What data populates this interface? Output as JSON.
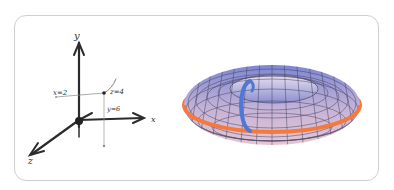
{
  "figure": {
    "left_panel": {
      "type": "hand-drawn 3D coordinate axes",
      "axes": {
        "x_label": "x",
        "y_label": "y",
        "z_label": "z"
      },
      "point_annotations": {
        "x": "x=2",
        "y": "y=6",
        "z": "z=4"
      }
    },
    "right_panel": {
      "type": "torus surface with two loops",
      "loops": [
        {
          "name": "longitude loop",
          "color": "#f4793b"
        },
        {
          "name": "meridian loop",
          "color": "#4f77d6"
        }
      ],
      "surface_gradient": [
        "#7e87d2",
        "#e7c6d3"
      ],
      "mesh_color": "#3a3a52"
    }
  }
}
